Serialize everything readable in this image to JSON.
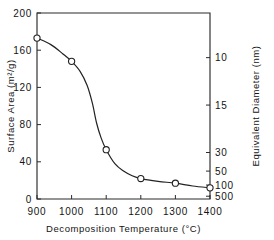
{
  "chart_data": {
    "type": "line",
    "title": "",
    "xlabel": "Decomposition Temperature  (°C)",
    "ylabel": "Surface Area  (m²/g)",
    "y2label": "Equivalent Diameter  (nm)",
    "xlim": [
      900,
      1400
    ],
    "ylim": [
      0,
      200
    ],
    "grid": false,
    "legend": null,
    "xticks": [
      900,
      1000,
      1100,
      1200,
      1300,
      1400
    ],
    "xtick_labels": [
      "900",
      "1000",
      "1100",
      "1200",
      "1300",
      "1400"
    ],
    "yticks": [
      0,
      40,
      80,
      120,
      160,
      200
    ],
    "ytick_labels": [
      "0",
      "40",
      "80",
      "120",
      "160",
      "200"
    ],
    "y2ticks": [
      {
        "label": "10",
        "surface_area": 152
      },
      {
        "label": "15",
        "surface_area": 101
      },
      {
        "label": "30",
        "surface_area": 50
      },
      {
        "label": "50",
        "surface_area": 30
      },
      {
        "label": "100",
        "surface_area": 15
      },
      {
        "label": "500",
        "surface_area": 3
      }
    ],
    "marker": "open-circle",
    "x": [
      900,
      1000,
      1100,
      1200,
      1300,
      1400
    ],
    "values": [
      173,
      148,
      53,
      22,
      17,
      12
    ],
    "series": [
      {
        "name": "Surface area vs decomposition temperature",
        "x": [
          900,
          1000,
          1100,
          1200,
          1300,
          1400
        ],
        "values": [
          173,
          148,
          53,
          22,
          17,
          12
        ]
      }
    ],
    "curve_path_points": [
      {
        "x": 900,
        "y": 173
      },
      {
        "x": 940,
        "y": 166
      },
      {
        "x": 975,
        "y": 156
      },
      {
        "x": 1000,
        "y": 148
      },
      {
        "x": 1025,
        "y": 137
      },
      {
        "x": 1045,
        "y": 122
      },
      {
        "x": 1060,
        "y": 103
      },
      {
        "x": 1072,
        "y": 82
      },
      {
        "x": 1085,
        "y": 66
      },
      {
        "x": 1100,
        "y": 53
      },
      {
        "x": 1125,
        "y": 38
      },
      {
        "x": 1150,
        "y": 30
      },
      {
        "x": 1175,
        "y": 25
      },
      {
        "x": 1200,
        "y": 22
      },
      {
        "x": 1250,
        "y": 19
      },
      {
        "x": 1300,
        "y": 17
      },
      {
        "x": 1350,
        "y": 14
      },
      {
        "x": 1400,
        "y": 12
      }
    ]
  },
  "axes": {
    "x_title": "Decomposition Temperature  (°C)",
    "y_left_title": "Surface Area  (m²/g)",
    "y_right_title": "Equivalent Diameter  (nm)"
  },
  "colors": {
    "line": "#222222",
    "frame": "#2b2b2b",
    "marker_fill": "#ffffff",
    "background": "#ffffff",
    "text": "#141414"
  }
}
